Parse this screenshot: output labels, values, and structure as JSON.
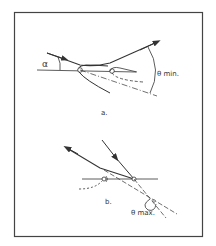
{
  "figure": {
    "panel_a": {
      "label": "a.",
      "angle_alpha": "α",
      "angle_theta": "θ min."
    },
    "panel_b": {
      "label": "b.",
      "angle_theta": "θ max."
    },
    "colors": {
      "ink": "#333333",
      "border": "#444444",
      "background": "#ffffff"
    }
  }
}
